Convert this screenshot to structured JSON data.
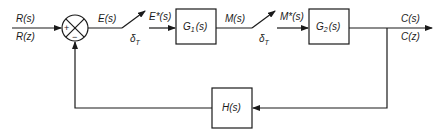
{
  "diagram": {
    "type": "sampled-data feedback control block diagram",
    "input": {
      "label_s": "R(s)",
      "label_z": "R(z)"
    },
    "summing_junction": {
      "plus_sign": "+",
      "minus_sign": "−"
    },
    "error_signal": "E(s)",
    "sampler1": {
      "label": "δ",
      "subscript": "T",
      "output": "E*(s)"
    },
    "block_g1": {
      "name": "G",
      "subscript": "1",
      "arg": "(s)",
      "output": "M(s)"
    },
    "sampler2": {
      "label": "δ",
      "subscript": "T",
      "output": "M*(s)"
    },
    "block_g2": {
      "name": "G",
      "subscript": "2",
      "arg": "(s)"
    },
    "output": {
      "label_s": "C(s)",
      "label_z": "C(z)"
    },
    "feedback_block": {
      "label": "H(s)"
    }
  }
}
